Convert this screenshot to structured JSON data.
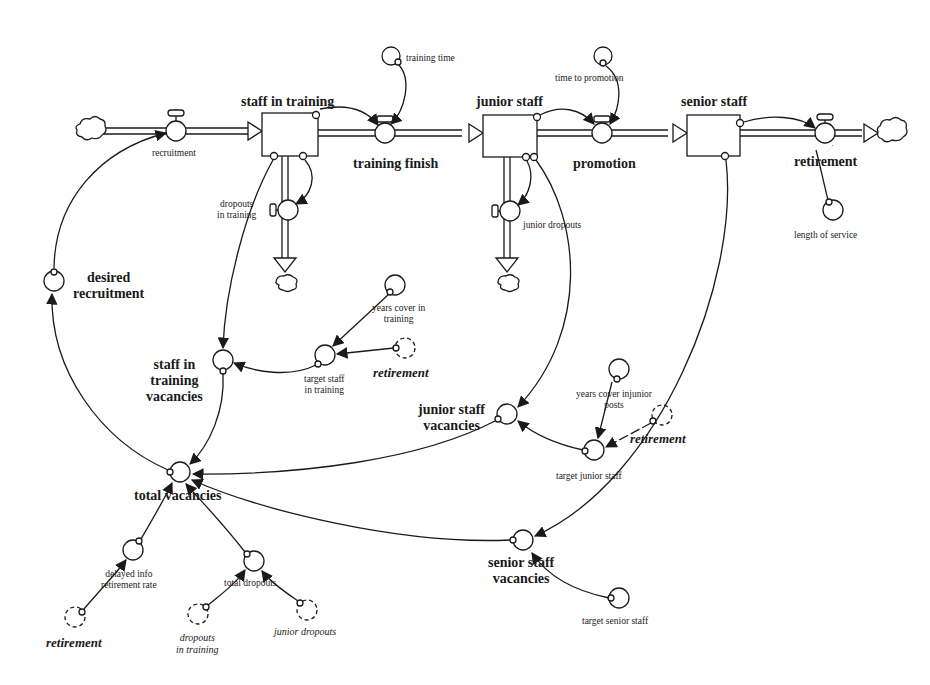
{
  "diagram": {
    "type": "stock-and-flow",
    "stocks": [
      {
        "id": "staff_in_training",
        "label": "staff in training"
      },
      {
        "id": "junior_staff",
        "label": "junior staff"
      },
      {
        "id": "senior_staff",
        "label": "senior staff"
      }
    ],
    "flows": [
      {
        "id": "recruitment",
        "label": "recruitment"
      },
      {
        "id": "training_finish",
        "label": "training finish"
      },
      {
        "id": "promotion",
        "label": "promotion"
      },
      {
        "id": "retirement",
        "label": "retirement"
      },
      {
        "id": "dropouts_in_training",
        "label_line1": "dropouts",
        "label_line2": "in training"
      },
      {
        "id": "junior_dropouts",
        "label": "junior dropouts"
      }
    ],
    "auxiliaries": {
      "training_time": "training time",
      "time_to_promotion": "time to promotion",
      "length_of_service": "length of service",
      "desired_recruitment_line1": "desired",
      "desired_recruitment_line2": "recruitment",
      "years_cover_in_training_line1": "years cover in",
      "years_cover_in_training_line2": "training",
      "target_staff_in_training_line1": "target staff",
      "target_staff_in_training_line2": "in training",
      "staff_in_training_vacancies_line1": "staff in",
      "staff_in_training_vacancies_line2": "training",
      "staff_in_training_vacancies_line3": "vacancies",
      "years_cover_injunior_line1": "years cover injunior",
      "years_cover_injunior_line2": "posts",
      "junior_staff_vacancies_line1": "junior staff",
      "junior_staff_vacancies_line2": "vacancies",
      "target_junior_staff": "target junior staff",
      "total_vacancies": "total vacancies",
      "delayed_info_line1": "delayed info",
      "delayed_info_line2": "retirement rate",
      "total_dropouts": "total dropouts",
      "senior_staff_vacancies_line1": "senior staff",
      "senior_staff_vacancies_line2": "vacancies",
      "target_senior_staff": "target senior staff"
    },
    "ghosts": {
      "retirement_1": "retirement",
      "retirement_2": "retirement",
      "retirement_3": "retirement",
      "dropouts_in_training_line1": "dropouts",
      "dropouts_in_training_line2": "in training",
      "junior_dropouts": "junior dropouts"
    },
    "colors": {
      "ink": "#1a1a1a",
      "background": "#ffffff"
    }
  }
}
